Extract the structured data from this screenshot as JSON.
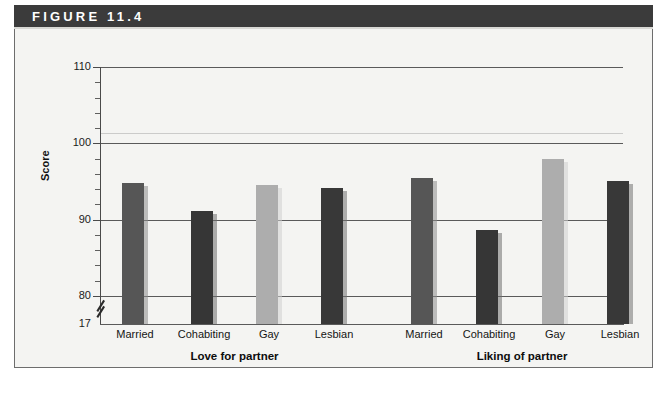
{
  "figure": {
    "header_label": "FIGURE 11.4"
  },
  "chart_data": {
    "type": "bar",
    "title": "",
    "xlabel": "",
    "ylabel": "Score",
    "ylim": [
      17,
      110
    ],
    "y_ticks": [
      110,
      100,
      90,
      80,
      17
    ],
    "y_tick_labels": [
      "110",
      "100",
      "90",
      "80",
      "17"
    ],
    "axis_break": true,
    "axis_break_between": [
      80,
      17
    ],
    "grid": true,
    "gridlines": [
      110,
      100,
      90,
      80
    ],
    "legend": "none",
    "groups": [
      {
        "label": "Love for partner",
        "categories": [
          "Married",
          "Cohabiting",
          "Gay",
          "Lesbian"
        ],
        "values": [
          94.8,
          91.2,
          94.6,
          94.1
        ]
      },
      {
        "label": "Liking of partner",
        "categories": [
          "Married",
          "Cohabiting",
          "Gay",
          "Lesbian"
        ],
        "values": [
          95.5,
          88.7,
          98.0,
          95.1
        ]
      }
    ],
    "bar_colors": {
      "married": "#565656",
      "cohabiting": "#363636",
      "gay": "#adadad",
      "lesbian": "#383838"
    },
    "bar_shadow_colors": {
      "married": "#8e8e8e",
      "cohabiting": "#6f6f6f",
      "gay": "#cfcfcf",
      "lesbian": "#737373"
    }
  },
  "colors": {
    "header_bar": "#3b3b3b",
    "header_text": "#ffffff",
    "panel_background": "#f4f4f2",
    "panel_border": "#6d6d6d",
    "gridline": "#5a5a5a",
    "axis": "#4a4a4a",
    "text": "#141414"
  }
}
